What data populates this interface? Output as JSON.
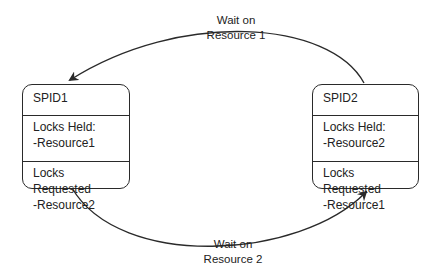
{
  "diagram": {
    "processes": [
      {
        "id": "SPID1",
        "locks_held_label": "Locks Held:",
        "locks_held": "-Resource1",
        "locks_requested_label": "Locks Requested",
        "locks_requested": "-Resource2"
      },
      {
        "id": "SPID2",
        "locks_held_label": "Locks Held:",
        "locks_held": "-Resource2",
        "locks_requested_label": "Locks Requested",
        "locks_requested": "-Resource1"
      }
    ],
    "edges": [
      {
        "from": "SPID2",
        "to": "SPID1",
        "label_line1": "Wait on",
        "label_line2": "Resource 1"
      },
      {
        "from": "SPID1",
        "to": "SPID2",
        "label_line1": "Wait on",
        "label_line2": "Resource 2"
      }
    ],
    "colors": {
      "line": "#2a2a2a",
      "background": "#ffffff"
    }
  }
}
